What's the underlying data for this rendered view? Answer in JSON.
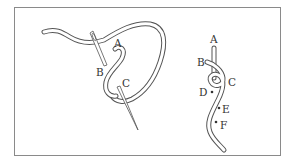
{
  "diagram": {
    "type": "embroidery-stitch-illustration",
    "colors": {
      "line": "#555555",
      "thread_fill": "#ffffff",
      "frame": "#8a8a8a",
      "label": "#333333"
    },
    "left_figure": {
      "labels": [
        {
          "id": "A",
          "text": "A"
        },
        {
          "id": "B",
          "text": "B"
        },
        {
          "id": "C",
          "text": "C"
        }
      ]
    },
    "right_figure": {
      "labels": [
        {
          "id": "A",
          "text": "A"
        },
        {
          "id": "B",
          "text": "B"
        },
        {
          "id": "C",
          "text": "C"
        },
        {
          "id": "D",
          "text": "D"
        },
        {
          "id": "E",
          "text": "E"
        },
        {
          "id": "F",
          "text": "F"
        }
      ]
    }
  }
}
